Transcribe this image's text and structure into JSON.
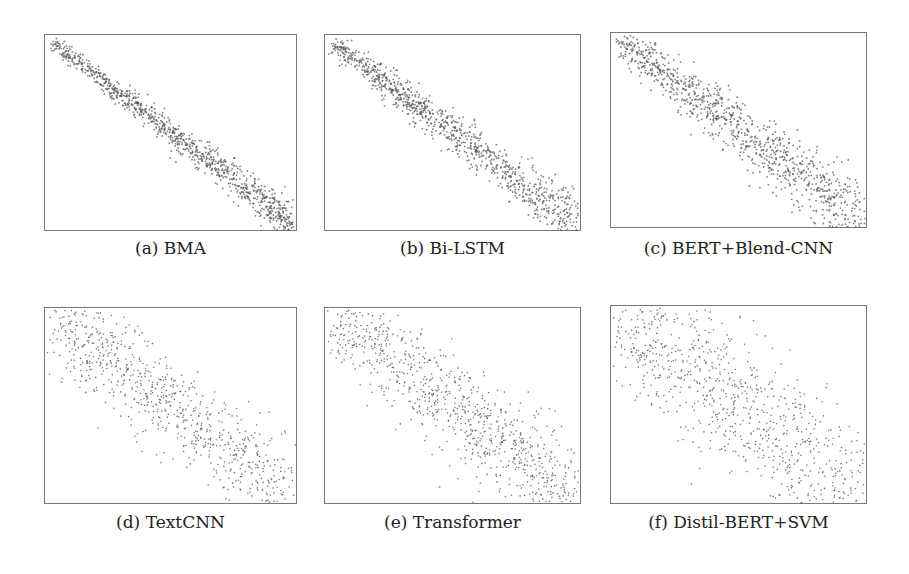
{
  "chart_data": [
    {
      "type": "scatter",
      "id": "a",
      "caption": "(a) BMA",
      "title": "BMA",
      "points": 1000,
      "spread": 0.035,
      "trend": "negative linear",
      "box": [
        44,
        34,
        253,
        197
      ],
      "cap_y": 249
    },
    {
      "type": "scatter",
      "id": "b",
      "caption": "(b) Bi-LSTM",
      "title": "Bi-LSTM",
      "points": 1000,
      "spread": 0.05,
      "trend": "negative linear",
      "box": [
        324,
        34,
        257,
        197
      ],
      "cap_y": 249
    },
    {
      "type": "scatter",
      "id": "c",
      "caption": "(c) BERT+Blend-CNN",
      "title": "BERT+Blend-CNN",
      "points": 1000,
      "spread": 0.07,
      "trend": "negative linear",
      "box": [
        610,
        32,
        257,
        196
      ],
      "cap_y": 249
    },
    {
      "type": "scatter",
      "id": "d",
      "caption": "(d) TextCNN",
      "title": "TextCNN",
      "points": 800,
      "spread": 0.12,
      "trend": "negative linear",
      "box": [
        44,
        307,
        253,
        197
      ],
      "cap_y": 523
    },
    {
      "type": "scatter",
      "id": "e",
      "caption": "(e) Transformer",
      "title": "Transformer",
      "points": 900,
      "spread": 0.12,
      "trend": "negative linear",
      "box": [
        324,
        307,
        257,
        197
      ],
      "cap_y": 523
    },
    {
      "type": "scatter",
      "id": "f",
      "caption": "(f) Distil-BERT+SVM",
      "title": "Distil-BERT+SVM",
      "points": 900,
      "spread": 0.18,
      "trend": "negative linear",
      "box": [
        610,
        305,
        257,
        199
      ],
      "cap_y": 523
    }
  ],
  "colors": {
    "point": "#555555",
    "border": "#777777"
  }
}
